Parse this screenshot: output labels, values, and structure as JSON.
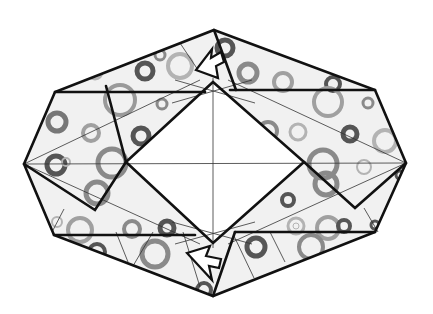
{
  "diagram": {
    "title": "Origami folding step: octagonal frame with center square opening",
    "colors": {
      "paper_fill": "#f1f1f1",
      "outline": "#111111",
      "crease_line": "#333333",
      "ring_dark": "#555555",
      "ring_mid": "#8a8a8a",
      "ring_light": "#b3b3b3",
      "arrow_fill": "#ffffff"
    },
    "outer_vertices": [
      [
        214,
        30
      ],
      [
        375,
        90
      ],
      [
        406,
        163
      ],
      [
        375,
        232
      ],
      [
        213,
        296
      ],
      [
        54,
        235
      ],
      [
        24,
        164
      ],
      [
        55,
        92
      ]
    ],
    "inner_diamond": [
      [
        213,
        82
      ],
      [
        304,
        162
      ],
      [
        213,
        243
      ],
      [
        126,
        162
      ]
    ],
    "arrows": [
      {
        "name": "top-open-arrow",
        "direction": "down-left",
        "position": [
          212,
          62
        ]
      },
      {
        "name": "bottom-open-arrow",
        "direction": "up-left",
        "position": [
          205,
          265
        ]
      }
    ],
    "labels": []
  }
}
